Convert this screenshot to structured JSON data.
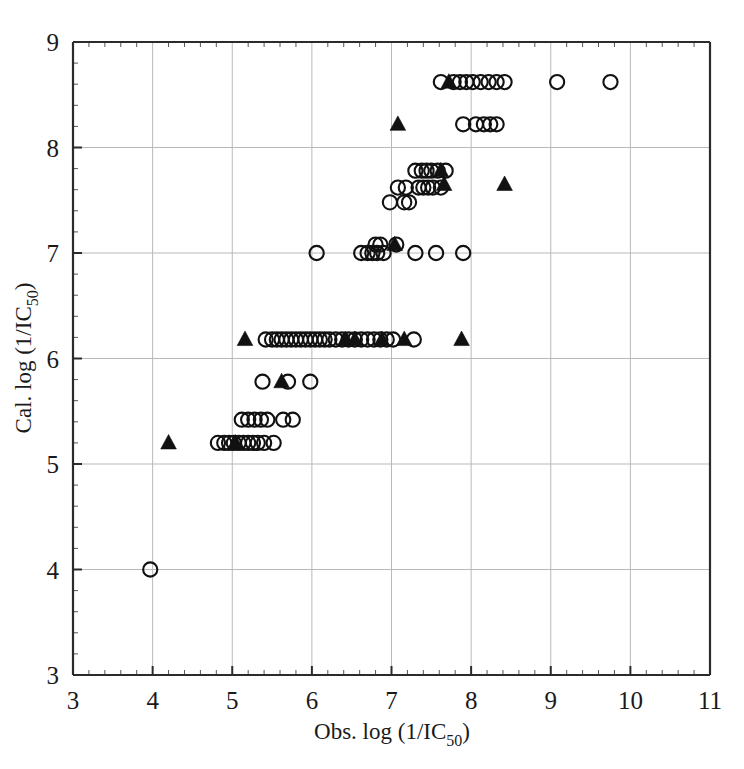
{
  "chart_data": {
    "type": "scatter",
    "title": "",
    "xlabel": "Obs. log (1/IC50)",
    "xlabel_main": "Obs. log (1/IC",
    "xlabel_sub": "50",
    "xlabel_tail": ")",
    "ylabel": "Cal. log (1/IC50)",
    "ylabel_main": "Cal. log (1/IC",
    "ylabel_sub": "50",
    "ylabel_tail": ")",
    "xlim": [
      3,
      11
    ],
    "ylim": [
      3,
      9
    ],
    "xticks": [
      3,
      4,
      5,
      6,
      7,
      8,
      9,
      10,
      11
    ],
    "yticks": [
      3,
      4,
      5,
      6,
      7,
      8,
      9
    ],
    "xtick_labels": [
      "3",
      "4",
      "5",
      "6",
      "7",
      "8",
      "9",
      "10",
      "11"
    ],
    "ytick_labels": [
      "3",
      "4",
      "5",
      "6",
      "7",
      "8",
      "9"
    ],
    "minor_ticks_per_interval": 5,
    "grid": true,
    "grid_color": "#b9b9b9",
    "legend": [],
    "legend_position": "none",
    "marker_color": "#111111",
    "series": [
      {
        "name": "open-circle",
        "marker": "circle-open",
        "points": [
          [
            3.97,
            4.0
          ],
          [
            4.82,
            5.2
          ],
          [
            4.9,
            5.2
          ],
          [
            4.96,
            5.2
          ],
          [
            5.02,
            5.2
          ],
          [
            5.08,
            5.2
          ],
          [
            5.14,
            5.2
          ],
          [
            5.2,
            5.2
          ],
          [
            5.26,
            5.2
          ],
          [
            5.32,
            5.2
          ],
          [
            5.4,
            5.2
          ],
          [
            5.52,
            5.2
          ],
          [
            5.12,
            5.42
          ],
          [
            5.2,
            5.42
          ],
          [
            5.28,
            5.42
          ],
          [
            5.36,
            5.42
          ],
          [
            5.44,
            5.42
          ],
          [
            5.64,
            5.42
          ],
          [
            5.76,
            5.42
          ],
          [
            5.38,
            5.78
          ],
          [
            5.7,
            5.78
          ],
          [
            5.98,
            5.78
          ],
          [
            5.42,
            6.18
          ],
          [
            5.5,
            6.18
          ],
          [
            5.56,
            6.18
          ],
          [
            5.62,
            6.18
          ],
          [
            5.68,
            6.18
          ],
          [
            5.74,
            6.18
          ],
          [
            5.8,
            6.18
          ],
          [
            5.86,
            6.18
          ],
          [
            5.92,
            6.18
          ],
          [
            5.98,
            6.18
          ],
          [
            6.04,
            6.18
          ],
          [
            6.1,
            6.18
          ],
          [
            6.16,
            6.18
          ],
          [
            6.22,
            6.18
          ],
          [
            6.3,
            6.18
          ],
          [
            6.38,
            6.18
          ],
          [
            6.46,
            6.18
          ],
          [
            6.54,
            6.18
          ],
          [
            6.62,
            6.18
          ],
          [
            6.7,
            6.18
          ],
          [
            6.78,
            6.18
          ],
          [
            6.86,
            6.18
          ],
          [
            6.94,
            6.18
          ],
          [
            7.02,
            6.18
          ],
          [
            7.28,
            6.18
          ],
          [
            6.06,
            7.0
          ],
          [
            6.62,
            7.0
          ],
          [
            6.7,
            7.0
          ],
          [
            6.76,
            7.0
          ],
          [
            6.82,
            7.0
          ],
          [
            6.8,
            7.08
          ],
          [
            6.86,
            7.08
          ],
          [
            6.9,
            7.0
          ],
          [
            7.06,
            7.08
          ],
          [
            7.3,
            7.0
          ],
          [
            7.56,
            7.0
          ],
          [
            7.9,
            7.0
          ],
          [
            6.98,
            7.48
          ],
          [
            7.16,
            7.48
          ],
          [
            7.22,
            7.48
          ],
          [
            7.08,
            7.62
          ],
          [
            7.18,
            7.62
          ],
          [
            7.34,
            7.62
          ],
          [
            7.4,
            7.62
          ],
          [
            7.46,
            7.62
          ],
          [
            7.52,
            7.62
          ],
          [
            7.62,
            7.62
          ],
          [
            7.3,
            7.78
          ],
          [
            7.38,
            7.78
          ],
          [
            7.44,
            7.78
          ],
          [
            7.5,
            7.78
          ],
          [
            7.58,
            7.78
          ],
          [
            7.68,
            7.78
          ],
          [
            7.9,
            8.22
          ],
          [
            8.06,
            8.22
          ],
          [
            8.16,
            8.22
          ],
          [
            8.24,
            8.22
          ],
          [
            8.32,
            8.22
          ],
          [
            7.62,
            8.62
          ],
          [
            7.78,
            8.62
          ],
          [
            7.86,
            8.62
          ],
          [
            7.94,
            8.62
          ],
          [
            8.02,
            8.62
          ],
          [
            8.12,
            8.62
          ],
          [
            8.22,
            8.62
          ],
          [
            8.32,
            8.62
          ],
          [
            8.42,
            8.62
          ],
          [
            9.08,
            8.62
          ],
          [
            9.75,
            8.62
          ]
        ]
      },
      {
        "name": "filled-triangle",
        "marker": "triangle-filled",
        "points": [
          [
            4.2,
            5.2
          ],
          [
            5.04,
            5.2
          ],
          [
            5.62,
            5.78
          ],
          [
            5.16,
            6.18
          ],
          [
            6.42,
            6.18
          ],
          [
            6.54,
            6.18
          ],
          [
            6.88,
            6.18
          ],
          [
            7.16,
            6.18
          ],
          [
            7.88,
            6.18
          ],
          [
            7.04,
            7.08
          ],
          [
            7.66,
            7.65
          ],
          [
            8.42,
            7.65
          ],
          [
            7.62,
            7.78
          ],
          [
            7.08,
            8.22
          ],
          [
            7.72,
            8.62
          ]
        ]
      }
    ]
  },
  "axes": {
    "x_axis_name": "x-axis",
    "y_axis_name": "y-axis"
  }
}
